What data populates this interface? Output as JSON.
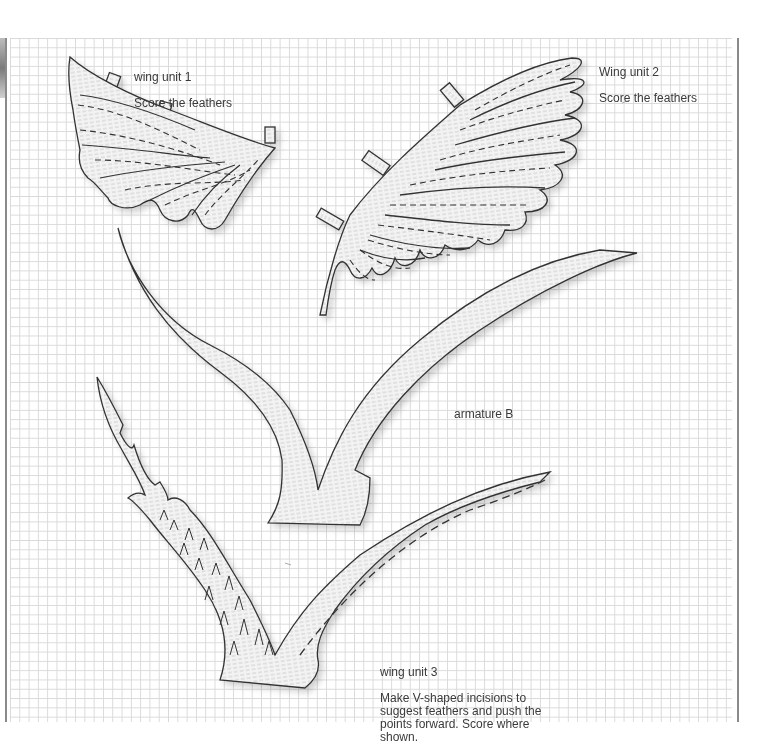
{
  "sheet": {
    "type": "craft cutout template on graph paper",
    "colors": {
      "grid": "#d9d9d9",
      "outline": "#333333",
      "fill": "#f2f2f2",
      "text": "#3a3a3a"
    }
  },
  "pieces": [
    {
      "id": "wing-unit-1",
      "label_title": "wing unit 1",
      "label_note": "Score the feathers"
    },
    {
      "id": "wing-unit-2",
      "label_title": "Wing unit 2",
      "label_note": "Score the feathers"
    },
    {
      "id": "armature-b",
      "label_title": "armature B",
      "label_note": ""
    },
    {
      "id": "wing-unit-3",
      "label_title": "wing unit 3",
      "label_note": "Make V-shaped incisions to\nsuggest feathers and push the\npoints forward. Score where\nshown."
    }
  ]
}
